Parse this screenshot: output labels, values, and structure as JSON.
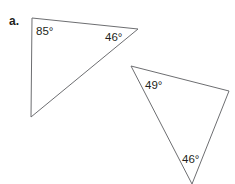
{
  "part_label": "a.",
  "triangles": [
    {
      "name": "triangle-1",
      "vertices": [
        [
          32,
          18
        ],
        [
          138,
          29
        ],
        [
          31,
          117
        ]
      ],
      "angles": [
        {
          "label": "85°",
          "x": 36,
          "y": 35
        },
        {
          "label": "46°",
          "x": 105,
          "y": 41
        }
      ]
    },
    {
      "name": "triangle-2",
      "vertices": [
        [
          131,
          66
        ],
        [
          229,
          91
        ],
        [
          192,
          184
        ]
      ],
      "angles": [
        {
          "label": "49°",
          "x": 145,
          "y": 89
        },
        {
          "label": "46°",
          "x": 182,
          "y": 163
        }
      ]
    }
  ],
  "colors": {
    "stroke": "#6d6e71",
    "text": "#231f20"
  }
}
